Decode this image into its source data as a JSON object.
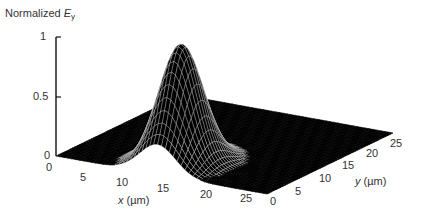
{
  "chart_data": {
    "type": "surface3d",
    "title_main": "Normalized ",
    "title_var": "E",
    "title_sub": "y",
    "xlabel": "x (µm)",
    "xlabel_var": "x",
    "xlabel_unit": " (µm)",
    "ylabel": "y (µm)",
    "ylabel_var": "y",
    "ylabel_unit": " (µm)",
    "zlabel": "Normalized E_y",
    "x_ticks": [
      "0",
      "5",
      "10",
      "15",
      "20",
      "25"
    ],
    "y_ticks": [
      "0",
      "5",
      "10",
      "15",
      "20",
      "25"
    ],
    "z_ticks": [
      "0",
      "0.5",
      "1"
    ],
    "xlim": [
      0,
      27
    ],
    "ylim": [
      0,
      27
    ],
    "zlim": [
      0,
      1
    ],
    "surface": {
      "function": "gaussian",
      "peak": 1.0,
      "center_x": 13,
      "center_y": 5,
      "sigma_x": 2.3,
      "sigma_y": 3.0,
      "grid_step": 0.5
    },
    "colors": {
      "surface_fill": "#000000",
      "mesh": "#d8d8d8",
      "axes": "#111111"
    },
    "grid": false,
    "legend": null
  }
}
